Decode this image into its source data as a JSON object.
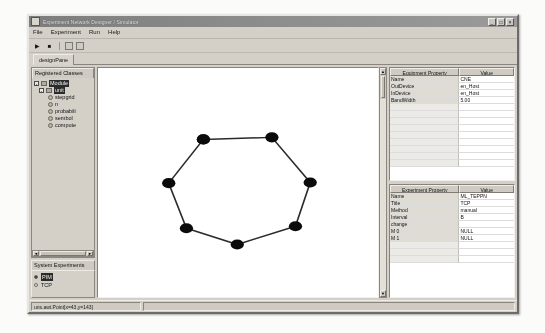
{
  "window": {
    "title": "Experiment Network Designer / Simulator",
    "icon": "app-icon",
    "controls": [
      {
        "name": "minimize-button",
        "glyph": "_"
      },
      {
        "name": "maximize-button",
        "glyph": "□"
      },
      {
        "name": "close-button",
        "glyph": "×"
      }
    ]
  },
  "menubar": {
    "items": [
      {
        "label": "File"
      },
      {
        "label": "Experiment"
      },
      {
        "label": "Run"
      },
      {
        "label": "Help"
      }
    ]
  },
  "toolbar": {
    "run_glyph": "▶",
    "stop_glyph": "■",
    "run_name": "run-button",
    "stop_name": "stop-button"
  },
  "tabs": {
    "items": [
      {
        "label": "designPane",
        "selected": true
      }
    ]
  },
  "sidebar": {
    "registered_classes": {
      "title": "Registered Classes",
      "tree": [
        {
          "label": "Module",
          "level": 0,
          "type": "folder",
          "handle": "-",
          "selected": true
        },
        {
          "label": "unit",
          "level": 1,
          "type": "folder",
          "handle": "-",
          "selected": true
        },
        {
          "label": "stepgrid",
          "level": 2,
          "type": "leaf"
        },
        {
          "label": "n",
          "level": 2,
          "type": "leaf"
        },
        {
          "label": "probabili",
          "level": 2,
          "type": "leaf"
        },
        {
          "label": "sembol",
          "level": 2,
          "type": "leaf"
        },
        {
          "label": "compute",
          "level": 2,
          "type": "leaf"
        }
      ],
      "hscroll_left": "◄",
      "hscroll_right": "►"
    },
    "system_experiments": {
      "title": "System Experiments",
      "items": [
        {
          "label": "PIM",
          "selected": true,
          "checked": true
        },
        {
          "label": "TCP",
          "selected": false,
          "checked": false
        }
      ]
    }
  },
  "canvas": {
    "name": "topology-canvas",
    "scroll_up_glyph": "▲",
    "scroll_down_glyph": "▼",
    "graph": {
      "type": "ring-topology",
      "node_count": 8,
      "node_color": "#0b0b0b",
      "edge_color": "#2a2a2a",
      "nodes": [
        {
          "id": "n1",
          "x": 143,
          "y": 106
        },
        {
          "id": "n2",
          "x": 236,
          "y": 103
        },
        {
          "id": "n3",
          "x": 288,
          "y": 170
        },
        {
          "id": "n4",
          "x": 268,
          "y": 235
        },
        {
          "id": "n5",
          "x": 189,
          "y": 262
        },
        {
          "id": "n6",
          "x": 120,
          "y": 238
        },
        {
          "id": "n7",
          "x": 96,
          "y": 171
        },
        {
          "id": "n8",
          "x": 143,
          "y": 106
        }
      ],
      "edges": [
        [
          "n1",
          "n2"
        ],
        [
          "n2",
          "n3"
        ],
        [
          "n3",
          "n4"
        ],
        [
          "n4",
          "n5"
        ],
        [
          "n5",
          "n6"
        ],
        [
          "n6",
          "n7"
        ],
        [
          "n7",
          "n1"
        ]
      ]
    }
  },
  "properties_top": {
    "header_name": "Equipment Property",
    "header_value": "Value",
    "rows": [
      {
        "name": "Name",
        "value": "CNE"
      },
      {
        "name": "OutDevice",
        "value": "en_Host"
      },
      {
        "name": "InDevice",
        "value": "en_Host"
      },
      {
        "name": "BandWidth",
        "value": "5.00"
      }
    ],
    "empty_rows": 9
  },
  "properties_bottom": {
    "header_name": "Experiment Property",
    "header_value": "Value",
    "rows": [
      {
        "name": "Name",
        "value": "ML_TEPPN"
      },
      {
        "name": "Title",
        "value": "TCP"
      },
      {
        "name": "Method",
        "value": "manual"
      },
      {
        "name": "Interval",
        "value": "B"
      },
      {
        "name": "change",
        "value": ""
      },
      {
        "name": "M 0",
        "value": "NULL"
      },
      {
        "name": "M 1",
        "value": "NULL"
      }
    ],
    "empty_rows": 3
  },
  "statusbar": {
    "text": "uns.awt.Point[x=43,y=143]"
  }
}
